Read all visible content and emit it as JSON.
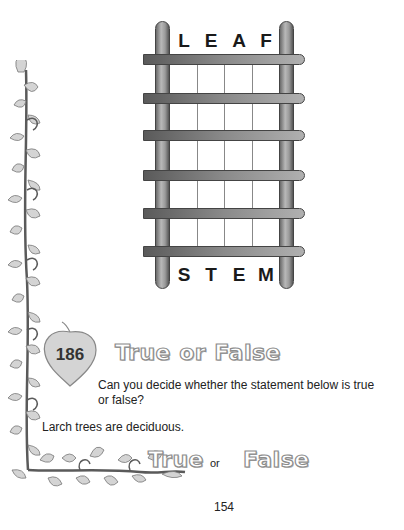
{
  "puzzle": {
    "top_word": [
      "L",
      "E",
      "A",
      "F"
    ],
    "bottom_word": [
      "S",
      "T",
      "E",
      "M"
    ],
    "rung_count": 6,
    "columns": 4
  },
  "question": {
    "number": "186",
    "title": "True or False",
    "prompt": "Can you decide whether the statement below is true or false?",
    "statement": "Larch trees are deciduous.",
    "option_true": "True",
    "option_or": "or",
    "option_false": "False"
  },
  "page_number": "154",
  "colors": {
    "ladder_dark": "#555555",
    "ladder_light": "#b8b8b8",
    "outline_text": "#8c8c8c",
    "leaf_fill": "#d4d4d4",
    "vine": "#5a5a5a"
  }
}
